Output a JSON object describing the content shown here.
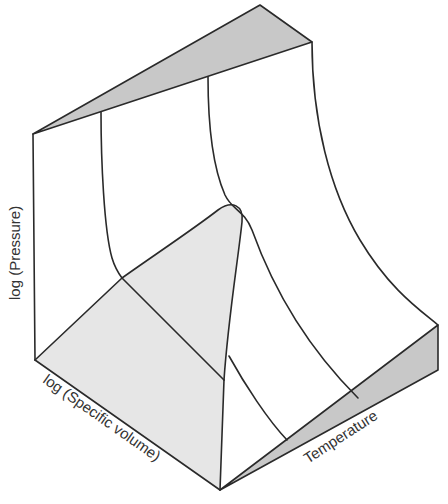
{
  "figure": {
    "type": "PVT surface (3D thermodynamic surface)",
    "axes": {
      "pressure_label": "log (Pressure)",
      "volume_label": "log (Specific volume)",
      "temperature_label": "Temperature"
    },
    "colors": {
      "line": "#2a2a2a",
      "dark_shade": "#c8c8c8",
      "light_shade": "#e6e6e6",
      "background": "#ffffff"
    }
  }
}
